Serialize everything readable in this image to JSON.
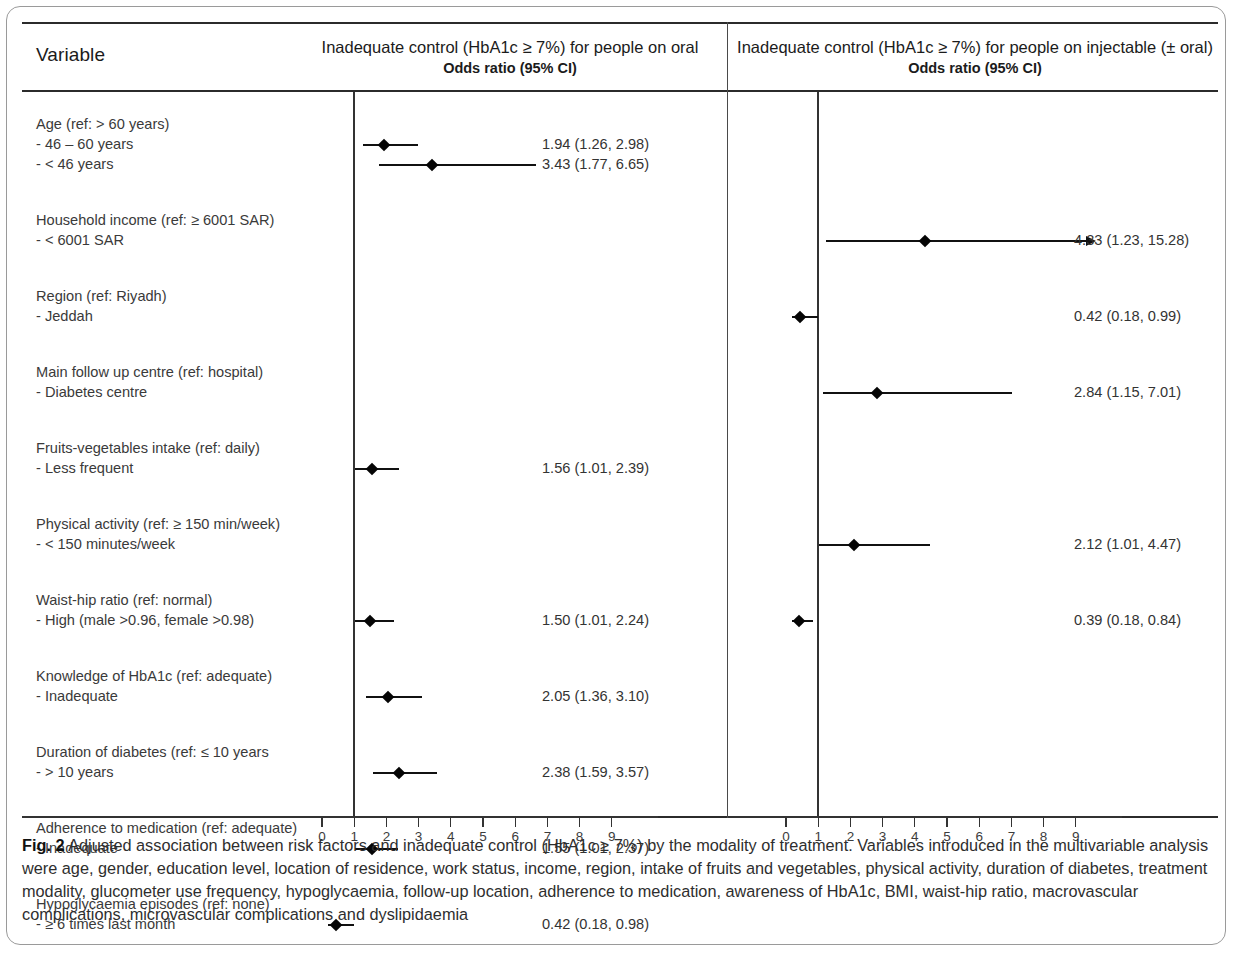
{
  "figure": {
    "number": "Fig. 2",
    "caption": " Adjusted association between risk factors and inadequate control (HbA1c ≥ 7%) by the modality of treatment. Variables introduced in the multivariable analysis were age, gender, education level, location of residence, work status, income, region, intake of fruits and vegetables, physical activity, duration of diabetes, treatment modality, glucometer use frequency, hypoglycaemia, follow-up location, adherence to medication, awareness of HbA1c, BMI, waist-hip ratio, macrovascular complications, microvascular complications and dyslipidaemia"
  },
  "table": {
    "header": {
      "variable": "Variable",
      "left_title": "Inadequate control (HbA1c ≥ 7%) for people on oral",
      "left_sub": "Odds ratio (95% CI)",
      "right_title": "Inadequate control (HbA1c ≥ 7%) for people on injectable (± oral)",
      "right_sub": "Odds ratio (95% CI)"
    }
  },
  "chart_data": {
    "type": "scatter",
    "title": "Adjusted association between risk factors and inadequate control (HbA1c ≥ 7%) by the modality of treatment",
    "xlabel": "Odds ratio (95% CI)",
    "ylabel": "Variable",
    "xlim": [
      0,
      9.5
    ],
    "reference_line": 1,
    "grid": false,
    "legend": "none",
    "xticks": [
      "0",
      "1",
      "2",
      "3",
      "4",
      "5",
      "6",
      "7",
      "8",
      "9"
    ],
    "panels": [
      {
        "name": "oral",
        "label": "Inadequate control (HbA1c ≥ 7%) for people on oral"
      },
      {
        "name": "injectable",
        "label": "Inadequate control (HbA1c ≥ 7%) for people on injectable (± oral)"
      }
    ],
    "rows": [
      {
        "group": "Age (ref: > 60 years)",
        "levels": [
          {
            "label": "- 46 – 60 years",
            "oral": {
              "or": 1.94,
              "low": 1.26,
              "high": 2.98,
              "text": "1.94 (1.26, 2.98)"
            },
            "injectable": null
          },
          {
            "label": "- < 46 years",
            "oral": {
              "or": 3.43,
              "low": 1.77,
              "high": 6.65,
              "text": "3.43 (1.77, 6.65)"
            },
            "injectable": null
          }
        ]
      },
      {
        "group": "Household income (ref: ≥ 6001 SAR)",
        "levels": [
          {
            "label": "- < 6001 SAR",
            "oral": null,
            "injectable": {
              "or": 4.33,
              "low": 1.23,
              "high": 15.28,
              "text": "4.33 (1.23, 15.28)",
              "truncated_high": true
            }
          }
        ]
      },
      {
        "group": "Region (ref: Riyadh)",
        "levels": [
          {
            "label": "- Jeddah",
            "oral": null,
            "injectable": {
              "or": 0.42,
              "low": 0.18,
              "high": 0.99,
              "text": "0.42 (0.18, 0.99)"
            }
          }
        ]
      },
      {
        "group": "Main follow up centre (ref: hospital)",
        "levels": [
          {
            "label": "- Diabetes centre",
            "oral": null,
            "injectable": {
              "or": 2.84,
              "low": 1.15,
              "high": 7.01,
              "text": "2.84 (1.15, 7.01)"
            }
          }
        ]
      },
      {
        "group": "Fruits-vegetables intake (ref: daily)",
        "levels": [
          {
            "label": "- Less frequent",
            "oral": {
              "or": 1.56,
              "low": 1.01,
              "high": 2.39,
              "text": "1.56 (1.01, 2.39)"
            },
            "injectable": null
          }
        ]
      },
      {
        "group": "Physical activity (ref: ≥ 150 min/week)",
        "levels": [
          {
            "label": "- < 150 minutes/week",
            "oral": null,
            "injectable": {
              "or": 2.12,
              "low": 1.01,
              "high": 4.47,
              "text": "2.12 (1.01, 4.47)"
            }
          }
        ]
      },
      {
        "group": "Waist-hip ratio (ref: normal)",
        "levels": [
          {
            "label": "- High (male >0.96, female >0.98)",
            "oral": {
              "or": 1.5,
              "low": 1.01,
              "high": 2.24,
              "text": "1.50 (1.01, 2.24)"
            },
            "injectable": {
              "or": 0.39,
              "low": 0.18,
              "high": 0.84,
              "text": "0.39 (0.18, 0.84)"
            }
          }
        ]
      },
      {
        "group": "Knowledge of HbA1c (ref: adequate)",
        "levels": [
          {
            "label": "- Inadequate",
            "oral": {
              "or": 2.05,
              "low": 1.36,
              "high": 3.1,
              "text": "2.05 (1.36, 3.10)"
            },
            "injectable": null
          }
        ]
      },
      {
        "group": "Duration of diabetes (ref: ≤ 10 years",
        "levels": [
          {
            "label": "- > 10 years",
            "oral": {
              "or": 2.38,
              "low": 1.59,
              "high": 3.57,
              "text": "2.38 (1.59, 3.57)"
            },
            "injectable": null
          }
        ]
      },
      {
        "group": "Adherence to medication (ref: adequate)",
        "levels": [
          {
            "label": "- Inadequate",
            "oral": {
              "or": 1.55,
              "low": 1.01,
              "high": 2.37,
              "text": "1.55 (1.01, 2.37)"
            },
            "injectable": null
          }
        ]
      },
      {
        "group": "Hypoglycaemia episodes (ref: none)",
        "levels": [
          {
            "label": "- ≥ 6 times last month",
            "oral": {
              "or": 0.42,
              "low": 0.18,
              "high": 0.98,
              "text": "0.42 (0.18, 0.98)"
            },
            "injectable": null
          }
        ]
      }
    ]
  }
}
